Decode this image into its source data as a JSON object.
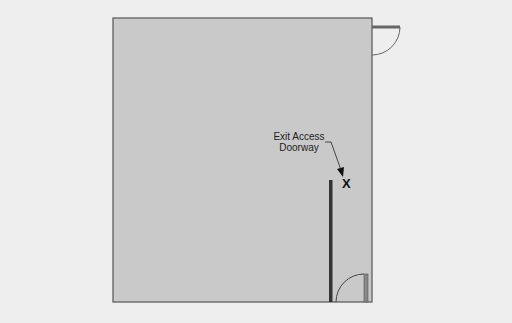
{
  "diagram": {
    "label": {
      "line1": "Exit Access",
      "line2": "Doorway"
    },
    "marker": "X",
    "colors": {
      "background": "#eeeeee",
      "room": "#c8c8c8",
      "wall": "#555555",
      "partition": "#333333",
      "door": "#666666"
    }
  }
}
